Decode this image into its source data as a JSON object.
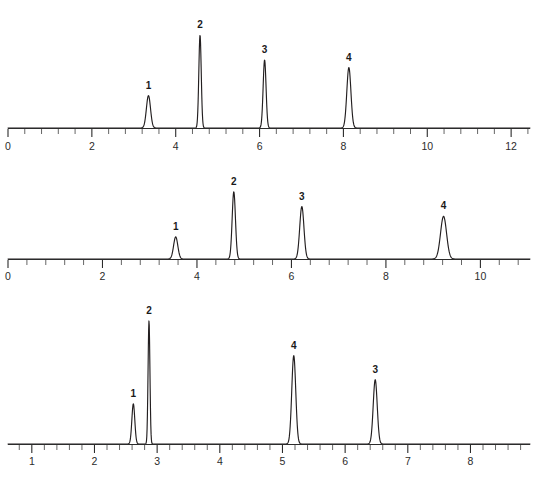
{
  "figure": {
    "kind": "chromatogram-set",
    "background": "#ffffff",
    "trace_color": "#231f20",
    "axis_color": "#2b2b2b",
    "label_color": "#1a1a1a"
  },
  "chart_data": [
    {
      "type": "line",
      "title": "",
      "xlabel": "",
      "ylabel": "",
      "xlim": [
        0,
        12.45
      ],
      "ylim": [
        0,
        1.0
      ],
      "grid": false,
      "legend": null,
      "axis_major_ticks": [
        0,
        2,
        4,
        6,
        8,
        10,
        12
      ],
      "axis_major_tick_labels": [
        "0",
        "2",
        "4",
        "6",
        "8",
        "10",
        "12"
      ],
      "axis_minor_tick_step": 0.4,
      "peaks": [
        {
          "label": "1",
          "retention_time": 3.35,
          "height": 0.3,
          "width": 0.115
        },
        {
          "label": "2",
          "retention_time": 4.58,
          "height": 0.86,
          "width": 0.068
        },
        {
          "label": "3",
          "retention_time": 6.12,
          "height": 0.63,
          "width": 0.082
        },
        {
          "label": "4",
          "retention_time": 8.13,
          "height": 0.56,
          "width": 0.115
        }
      ]
    },
    {
      "type": "line",
      "title": "",
      "xlabel": "",
      "ylabel": "",
      "xlim": [
        0,
        11.05
      ],
      "ylim": [
        0,
        1.0
      ],
      "grid": false,
      "legend": null,
      "axis_major_ticks": [
        0,
        2,
        4,
        6,
        8,
        10
      ],
      "axis_major_tick_labels": [
        "0",
        "2",
        "4",
        "6",
        "8",
        "10"
      ],
      "axis_minor_tick_step": 0.4,
      "peaks": [
        {
          "label": "1",
          "retention_time": 3.55,
          "height": 0.27,
          "width": 0.105
        },
        {
          "label": "2",
          "retention_time": 4.78,
          "height": 0.82,
          "width": 0.082
        },
        {
          "label": "3",
          "retention_time": 6.22,
          "height": 0.64,
          "width": 0.105
        },
        {
          "label": "4",
          "retention_time": 9.22,
          "height": 0.52,
          "width": 0.15
        }
      ]
    },
    {
      "type": "line",
      "title": "",
      "xlabel": "",
      "ylabel": "",
      "xlim": [
        0.62,
        8.95
      ],
      "ylim": [
        0,
        1.0
      ],
      "grid": false,
      "legend": null,
      "axis_major_ticks": [
        1,
        2,
        3,
        4,
        5,
        6,
        7,
        8
      ],
      "axis_major_tick_labels": [
        "1",
        "2",
        "3",
        "4",
        "5",
        "6",
        "7",
        "8"
      ],
      "axis_minor_tick_step": 0.2,
      "peaks": [
        {
          "label": "1",
          "retention_time": 2.62,
          "height": 0.3,
          "width": 0.055
        },
        {
          "label": "2",
          "retention_time": 2.87,
          "height": 0.92,
          "width": 0.035
        },
        {
          "label": "4",
          "retention_time": 5.18,
          "height": 0.66,
          "width": 0.075
        },
        {
          "label": "3",
          "retention_time": 6.48,
          "height": 0.48,
          "width": 0.075
        }
      ]
    }
  ]
}
